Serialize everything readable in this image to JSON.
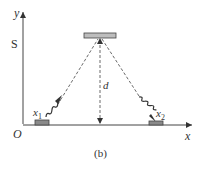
{
  "diagram": {
    "caption": "(b)",
    "axes": {
      "x_label": "x",
      "y_label": "y",
      "origin_label": "O"
    },
    "labels": {
      "source": "S",
      "distance": "d",
      "detector1": "x",
      "detector1_sub": "1",
      "detector2": "x",
      "detector2_sub": "2"
    },
    "elements": [
      {
        "name": "top-plate",
        "description": "horizontal reflector bar at top center"
      },
      {
        "name": "detector-x1",
        "description": "block on x-axis at left"
      },
      {
        "name": "detector-x2",
        "description": "block on x-axis at right"
      },
      {
        "name": "dashed-ray-left",
        "description": "dashed line from x1 to top plate with wavy photon"
      },
      {
        "name": "dashed-ray-right",
        "description": "dashed line from top plate to x2 with wavy photon"
      },
      {
        "name": "dashed-distance",
        "description": "vertical dashed double arrow d from plate to x-axis"
      }
    ],
    "colors": {
      "line": "#444444",
      "block_fill": "#8a8a8a",
      "plate_fill": "#bdbdbd"
    }
  }
}
